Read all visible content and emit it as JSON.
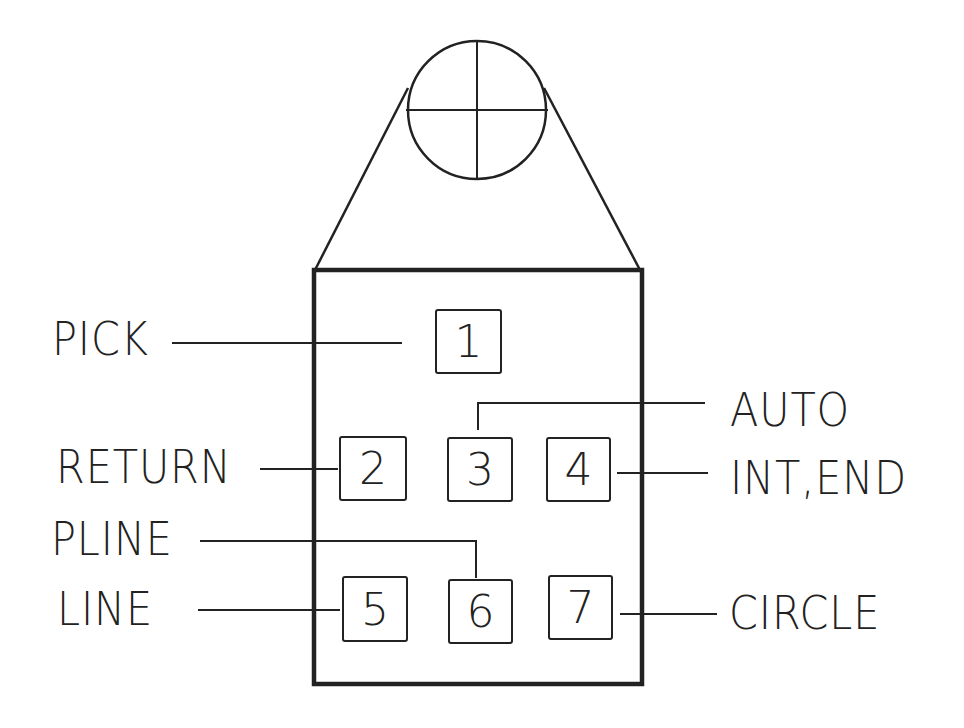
{
  "diagram": {
    "colors": {
      "stroke": "#222222",
      "background": "#ffffff"
    },
    "puck": {
      "crosshair": "crosshair-circle",
      "body": "rectangular-puck-body"
    },
    "buttons": [
      {
        "number": "1",
        "function": "PICK"
      },
      {
        "number": "2",
        "function": "RETURN"
      },
      {
        "number": "3",
        "function": "AUTO"
      },
      {
        "number": "4",
        "function": "INT,END"
      },
      {
        "number": "5",
        "function": "LINE"
      },
      {
        "number": "6",
        "function": "PLINE"
      },
      {
        "number": "7",
        "function": "CIRCLE"
      }
    ],
    "labels": {
      "pick": "PICK",
      "return": "RETURN",
      "auto": "AUTO",
      "int_end": "INT,END",
      "pline": "PLINE",
      "line": "LINE",
      "circle": "CIRCLE"
    }
  }
}
